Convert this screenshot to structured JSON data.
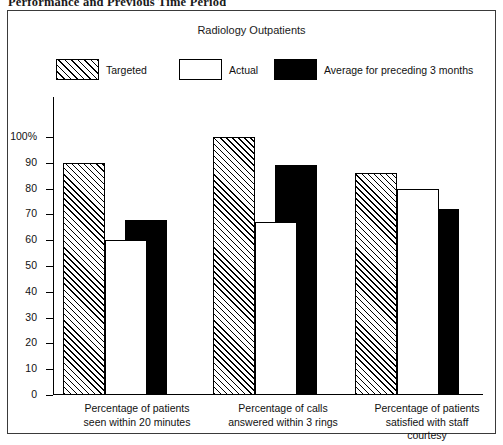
{
  "page": {
    "heading": "Performance and Previous Time Period"
  },
  "legend": {
    "items": [
      {
        "label": "Targeted",
        "swatch": "hatched-diagonal",
        "color": "#ffffff"
      },
      {
        "label": "Actual",
        "swatch": "open-white",
        "color": "#ffffff"
      },
      {
        "label": "Average for preceding 3 months",
        "swatch": "solid-black",
        "color": "#000000"
      }
    ]
  },
  "chart_data": {
    "type": "bar",
    "title": "Radiology Outpatients",
    "xlabel": "",
    "ylabel": "",
    "ylim": [
      0,
      100
    ],
    "grid": false,
    "legend_position": "top",
    "ytick_labels": [
      "100%",
      "90",
      "80",
      "70",
      "60",
      "50",
      "40",
      "30",
      "20",
      "10",
      "0"
    ],
    "yticks": [
      100,
      90,
      80,
      70,
      60,
      50,
      40,
      30,
      20,
      10,
      0
    ],
    "categories": [
      "Percentage of patients seen within 20 minutes",
      "Percentage of calls answered within 3 rings",
      "Percentage of patients satisfied with staff courtesy"
    ],
    "category_lines": [
      [
        "Percentage of patients",
        "seen within 20 minutes"
      ],
      [
        "Percentage of calls",
        "answered within 3 rings"
      ],
      [
        "Percentage of patients",
        "satisfied with staff",
        "courtesy"
      ]
    ],
    "series": [
      {
        "name": "Targeted",
        "values": [
          90,
          100,
          86
        ]
      },
      {
        "name": "Actual",
        "values": [
          60,
          67,
          80
        ]
      },
      {
        "name": "Average for preceding 3 months",
        "values": [
          68,
          89,
          72
        ]
      }
    ]
  }
}
